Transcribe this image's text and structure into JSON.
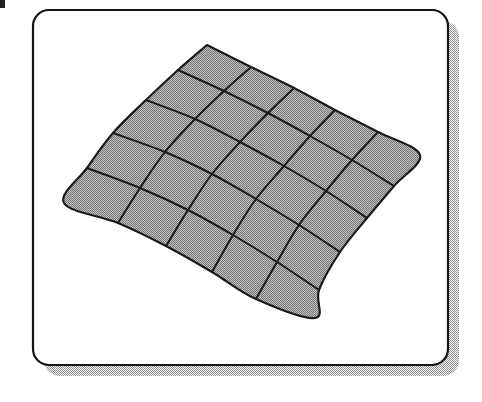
{
  "figure": {
    "canvas": {
      "width": 482,
      "height": 402,
      "background_color": "#ffffff"
    },
    "panel": {
      "name": "figure-panel",
      "x": 33,
      "y": 10,
      "width": 415,
      "height": 355,
      "corner_radius": 16,
      "fill_color": "#ffffff",
      "border_color": "#141418",
      "border_width": 2.2
    },
    "shadow": {
      "name": "panel-drop-shadow",
      "offset_x": 11,
      "offset_y": 11,
      "fill_color": "#b4b4b4",
      "pattern": "50% dithered halftone",
      "corner_radius": 16
    },
    "artifact": {
      "name": "corner-speck",
      "x": 0,
      "y": 0,
      "width": 5,
      "height": 8,
      "color": "#222226"
    }
  },
  "mesh": {
    "name": "deformed-grid-mesh",
    "rows": 5,
    "columns": 5,
    "vertex_rows": 6,
    "vertex_columns": 6,
    "cell_count": 25,
    "fill_color": "#a6a6a6",
    "fill_pattern": "dithered halftone gray",
    "line_color": "#1a1a1e",
    "line_width": 2.0,
    "outline_width": 2.2,
    "corners": {
      "top": [
        207,
        45
      ],
      "right": [
        420,
        155
      ],
      "bottom": [
        315,
        318
      ],
      "left": [
        64,
        203
      ]
    },
    "grid_points": [
      [
        [
          207,
          45
        ],
        [
          251,
          67
        ],
        [
          294,
          88
        ],
        [
          335,
          110
        ],
        [
          378,
          132
        ],
        [
          420,
          155
        ]
      ],
      [
        [
          178,
          70
        ],
        [
          224,
          91
        ],
        [
          268,
          113
        ],
        [
          310,
          136
        ],
        [
          352,
          160
        ],
        [
          394,
          186
        ]
      ],
      [
        [
          146,
          100
        ],
        [
          195,
          119
        ],
        [
          240,
          142
        ],
        [
          284,
          166
        ],
        [
          326,
          191
        ],
        [
          367,
          218
        ]
      ],
      [
        [
          113,
          133
        ],
        [
          165,
          152
        ],
        [
          212,
          174
        ],
        [
          256,
          199
        ],
        [
          299,
          225
        ],
        [
          340,
          252
        ]
      ],
      [
        [
          87,
          168
        ],
        [
          140,
          188
        ],
        [
          188,
          210
        ],
        [
          233,
          235
        ],
        [
          277,
          262
        ],
        [
          319,
          290
        ]
      ],
      [
        [
          64,
          203
        ],
        [
          118,
          223
        ],
        [
          166,
          246
        ],
        [
          212,
          272
        ],
        [
          256,
          299
        ],
        [
          315,
          318
        ]
      ]
    ]
  }
}
